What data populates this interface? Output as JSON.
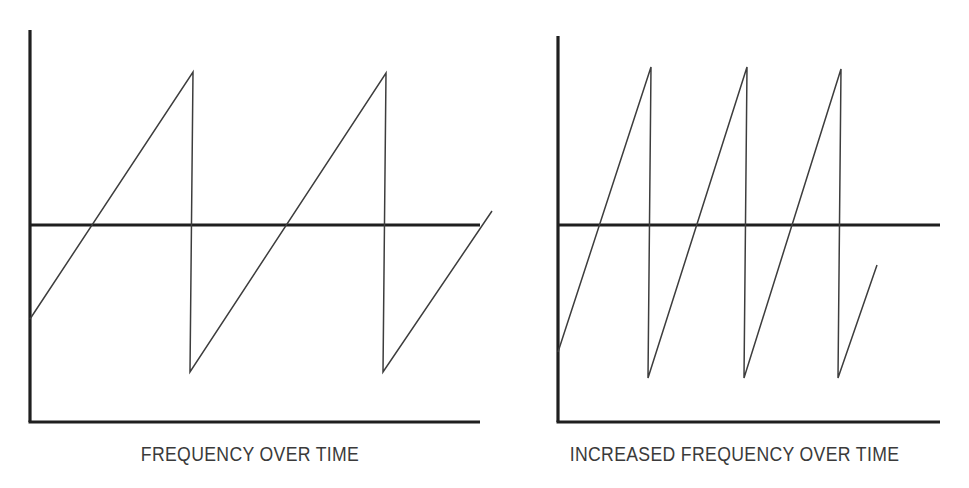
{
  "figure": {
    "title": "",
    "background_color": "#ffffff",
    "ink_color": "#1f1f1f",
    "wave_color": "#3d3d3d"
  },
  "panels": [
    {
      "id": "left",
      "caption": "FREQUENCY OVER TIME"
    },
    {
      "id": "right",
      "caption": "INCREASED FREQUENCY OVER TIME"
    }
  ],
  "chart_data": [
    {
      "type": "line",
      "title": "FREQUENCY OVER TIME",
      "waveform": "sawtooth",
      "cycles": 2.5,
      "xlabel": "",
      "ylabel": "",
      "grid": false,
      "legend": null,
      "axes": {
        "y_axis_x": 30,
        "y_axis_top": 30,
        "y_axis_bottom": 422,
        "x_axis_y": 422,
        "x_axis_left": 30,
        "x_axis_right": 480,
        "midline_y": 225,
        "midline_left": 30,
        "midline_right": 480
      },
      "points": [
        [
          30,
          319
        ],
        [
          193,
          72
        ],
        [
          190,
          372
        ],
        [
          386,
          73
        ],
        [
          383,
          372
        ],
        [
          492,
          211
        ]
      ],
      "description": "Sawtooth wave with two full rising ramps and a partial third ramp, crossing a horizontal zero line."
    },
    {
      "type": "line",
      "title": "INCREASED FREQUENCY OVER TIME",
      "waveform": "sawtooth",
      "cycles": 3.5,
      "xlabel": "",
      "ylabel": "",
      "grid": false,
      "legend": null,
      "axes": {
        "y_axis_x": 58,
        "y_axis_top": 36,
        "y_axis_bottom": 422,
        "x_axis_y": 422,
        "x_axis_left": 58,
        "x_axis_right": 440,
        "midline_y": 225,
        "midline_left": 58,
        "midline_right": 440
      },
      "points": [
        [
          58,
          352
        ],
        [
          151,
          67
        ],
        [
          148,
          378
        ],
        [
          247,
          67
        ],
        [
          244,
          378
        ],
        [
          341,
          69
        ],
        [
          338,
          378
        ],
        [
          377,
          265
        ]
      ],
      "description": "Sawtooth wave of higher frequency: three full rising ramps plus a partial fourth, crossing the same horizontal zero line."
    }
  ]
}
